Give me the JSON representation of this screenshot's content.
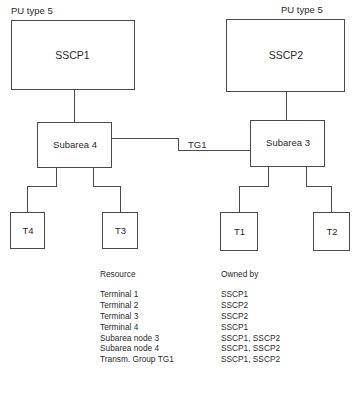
{
  "diagram": {
    "stroke_color": "#4a4a4a",
    "text_color": "#2b2b2b",
    "background": "#ffffff",
    "captions": {
      "pu_type_left": "PU type 5",
      "pu_type_right": "PU type 5"
    },
    "link_label": "TG1",
    "nodes": {
      "sscp1": "SSCP1",
      "sscp2": "SSCP2",
      "subarea4": "Subarea 4",
      "subarea3": "Subarea 3",
      "t4": "T4",
      "t3": "T3",
      "t1": "T1",
      "t2": "T2"
    }
  },
  "table": {
    "headers": {
      "resource": "Resource",
      "owned_by": "Owned by"
    },
    "rows": [
      {
        "resource": "Terminal 1",
        "owned_by": "SSCP1"
      },
      {
        "resource": "Terminal 2",
        "owned_by": "SSCP2"
      },
      {
        "resource": "Terminal 3",
        "owned_by": "SSCP2"
      },
      {
        "resource": "Terminal 4",
        "owned_by": "SSCP1"
      },
      {
        "resource": "Subarea node 3",
        "owned_by": "SSCP1, SSCP2"
      },
      {
        "resource": "Subarea node 4",
        "owned_by": "SSCP1, SSCP2"
      },
      {
        "resource": "Transm. Group TG1",
        "owned_by": "SSCP1, SSCP2"
      }
    ]
  }
}
